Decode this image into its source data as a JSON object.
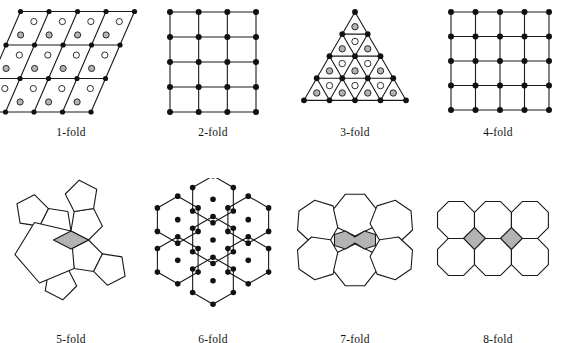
{
  "figure": {
    "caption_row_1_labels": [
      "1-fold",
      "2-fold",
      "3-fold",
      "4-fold"
    ],
    "caption_row_2_labels": [
      "5-fold",
      "6-fold",
      "7-fold",
      "8-fold"
    ],
    "colors": {
      "stroke": "#1a1a1a",
      "vertex_dot": "#111111",
      "gray_fill": "#b3b3b3",
      "white_fill": "#ffffff",
      "background": "#ffffff"
    },
    "panels": [
      {
        "id": "one-fold",
        "label": "1-fold",
        "symmetry_order": 1,
        "tiling": "oblique (parallelogram) lattice",
        "cells_across": 4,
        "cells_down": 3,
        "vertex_dots": true,
        "motif_circles": [
          "white-circle",
          "gray-circle"
        ]
      },
      {
        "id": "two-fold",
        "label": "2-fold",
        "symmetry_order": 2,
        "tiling": "rectangular lattice",
        "cells_across": 3,
        "cells_down": 4,
        "vertex_dots": true,
        "motif_circles": []
      },
      {
        "id": "three-fold",
        "label": "3-fold",
        "symmetry_order": 3,
        "tiling": "triangular lattice",
        "rows": 4,
        "vertex_dots": true,
        "motif_circles": [
          "gray-circle-up-triangle",
          "white-circle-down-triangle"
        ]
      },
      {
        "id": "four-fold",
        "label": "4-fold",
        "symmetry_order": 4,
        "tiling": "square lattice",
        "cells_across": 4,
        "cells_down": 4,
        "vertex_dots": true,
        "motif_circles": []
      },
      {
        "id": "five-fold",
        "label": "5-fold",
        "symmetry_order": 5,
        "tiling": "regular pentagons",
        "polygon_count": 8,
        "vertex_dots": false,
        "gap_shape": "gray rhombus"
      },
      {
        "id": "six-fold",
        "label": "6-fold",
        "symmetry_order": 6,
        "tiling": "regular hexagons",
        "polygon_count": 7,
        "vertex_dots": true,
        "gap_shape": "none"
      },
      {
        "id": "seven-fold",
        "label": "7-fold",
        "symmetry_order": 7,
        "tiling": "regular heptagons",
        "polygon_count": 6,
        "vertex_dots": false,
        "gap_shape": "gray bowtie hexagon"
      },
      {
        "id": "eight-fold",
        "label": "8-fold",
        "symmetry_order": 8,
        "tiling": "regular octagons",
        "polygon_count": 6,
        "vertex_dots": false,
        "gap_shape": "gray square"
      }
    ]
  }
}
